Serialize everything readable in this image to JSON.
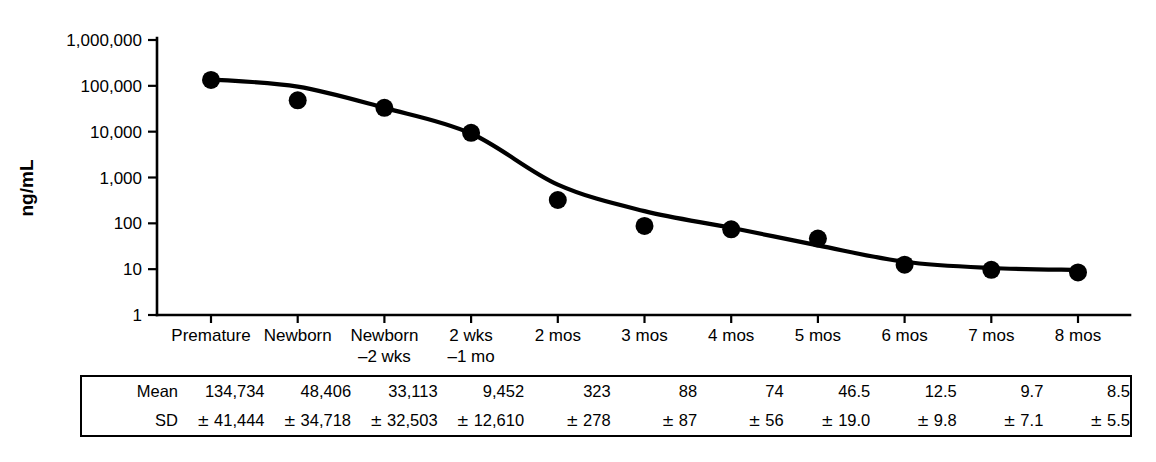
{
  "chart_data": {
    "type": "scatter",
    "title": "",
    "xlabel": "",
    "ylabel": "ng/mL",
    "yscale": "log",
    "ylim": [
      1,
      1000000
    ],
    "grid": false,
    "legend": null,
    "categories": [
      "Premature",
      "Newborn",
      "Newborn\n–2 wks",
      "2 wks\n–1 mo",
      "2 mos",
      "3 mos",
      "4 mos",
      "5 mos",
      "6 mos",
      "7 mos",
      "8 mos"
    ],
    "category_lines": [
      [
        "Premature",
        ""
      ],
      [
        "Newborn",
        ""
      ],
      [
        "Newborn",
        "–2 wks"
      ],
      [
        "2 wks",
        "–1 mo"
      ],
      [
        "2 mos",
        ""
      ],
      [
        "3 mos",
        ""
      ],
      [
        "4 mos",
        ""
      ],
      [
        "5 mos",
        ""
      ],
      [
        "6 mos",
        ""
      ],
      [
        "7 mos",
        ""
      ],
      [
        "8 mos",
        ""
      ]
    ],
    "ytick_labels": [
      "1,000,000",
      "100,000",
      "10,000",
      "1,000",
      "100",
      "10",
      "1"
    ],
    "ytick_values": [
      1000000,
      100000,
      10000,
      1000,
      100,
      10,
      1
    ],
    "series": [
      {
        "name": "Mean alpha-fetoprotein",
        "values": [
          134734,
          48406,
          33113,
          9452,
          323,
          88,
          74,
          46.5,
          12.5,
          9.7,
          8.5
        ]
      }
    ],
    "fit_curve": {
      "name": "fitted decay curve",
      "values": [
        138000,
        96000,
        33000,
        9100,
        700,
        185,
        80,
        33,
        14.5,
        10.6,
        9.6
      ]
    },
    "sd": [
      41444,
      34718,
      32503,
      12610,
      278,
      87,
      56,
      19.0,
      9.8,
      7.1,
      5.5
    ],
    "marker_color": "#000000",
    "curve_color": "#000000"
  },
  "table": {
    "row_labels": [
      "Mean",
      "SD"
    ],
    "mean": [
      "134,734",
      "48,406",
      "33,113",
      "9,452",
      "323",
      "88",
      "74",
      "46.5",
      "12.5",
      "9.7",
      "8.5"
    ],
    "sd": [
      "41,444",
      "34,718",
      "32,503",
      "12,610",
      "278",
      "87",
      "56",
      "19.0",
      "9.8",
      "7.1",
      "5.5"
    ],
    "pm_symbol": "±"
  }
}
